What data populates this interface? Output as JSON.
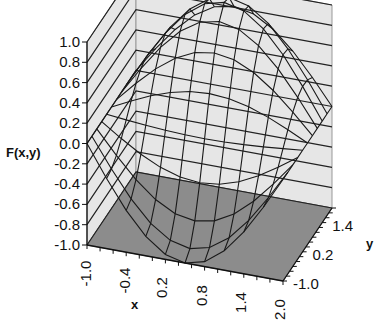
{
  "chart_data": {
    "type": "surface",
    "title": "",
    "xlabel": "x",
    "ylabel": "y",
    "zlabel": "F(x,y)",
    "x_ticks": [
      "-1.0",
      "-0.4",
      "0.2",
      "0.8",
      "1.4",
      "2.0"
    ],
    "y_ticks": [
      "-1.0",
      "0.2",
      "1.4"
    ],
    "z_ticks": [
      "1.0",
      "0.8",
      "0.6",
      "0.4",
      "0.2",
      "0.0",
      "-0.2",
      "-0.4",
      "-0.6",
      "-0.8",
      "-1.0"
    ],
    "xlim": [
      -1.0,
      2.0
    ],
    "ylim": [
      -1.0,
      2.0
    ],
    "zlim": [
      -1.0,
      1.0
    ],
    "grid": true,
    "wireframe": true,
    "x": [
      -1.0,
      -0.7,
      -0.4,
      -0.1,
      0.2,
      0.5,
      0.8,
      1.1,
      1.4,
      1.7,
      2.0
    ],
    "y": [
      -1.0,
      -0.7,
      -0.4,
      -0.1,
      0.2,
      0.5,
      0.8,
      1.1,
      1.4,
      1.7,
      2.0
    ],
    "z_peak": 1.0,
    "z_trough": -0.9,
    "colors": {
      "wall": "#e6e6e6",
      "floor": "#8c8c8c",
      "wire": "#1a1a1a",
      "gridline": "#222222"
    }
  },
  "labels": {
    "zlabel": "F(x,y)",
    "xlabel": "x",
    "ylabel": "y"
  }
}
